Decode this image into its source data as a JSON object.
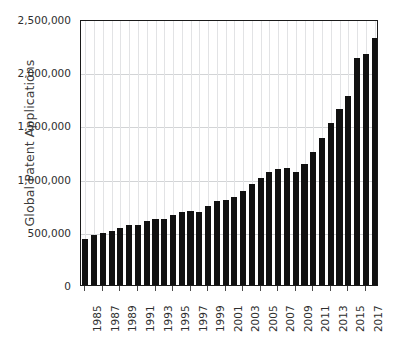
{
  "chart_data": {
    "type": "bar",
    "title": "",
    "xlabel": "",
    "ylabel": "Global Patent Applications",
    "ylim": [
      0,
      2500000
    ],
    "ytick_values": [
      2500000,
      2000000,
      1500000,
      1000000,
      500000,
      0
    ],
    "ytick_labels": [
      "2,500,000",
      "2,000,000",
      "1,500,000",
      "1,000,000",
      "500,000",
      "0"
    ],
    "xtick_labels": [
      "1985",
      "1987",
      "1989",
      "1991",
      "1993",
      "1995",
      "1997",
      "1999",
      "2001",
      "2003",
      "2005",
      "2007",
      "2009",
      "2011",
      "2013",
      "2015",
      "2017"
    ],
    "grid": "horizontal-and-vertical",
    "legend": "none",
    "bar_color": "#111111",
    "axis_color": "#1a1a1a",
    "gridline_color": "#d2d4d6",
    "background_color": "#ffffff",
    "categories": [
      "1985",
      "1986",
      "1987",
      "1988",
      "1989",
      "1990",
      "1991",
      "1992",
      "1993",
      "1994",
      "1995",
      "1996",
      "1997",
      "1998",
      "1999",
      "2000",
      "2001",
      "2002",
      "2003",
      "2004",
      "2005",
      "2006",
      "2007",
      "2008",
      "2009",
      "2010",
      "2011",
      "2012",
      "2013",
      "2014",
      "2015",
      "2016",
      "2017",
      "2018"
    ],
    "values": [
      435000,
      470000,
      490000,
      510000,
      540000,
      560000,
      565000,
      600000,
      620000,
      625000,
      660000,
      690000,
      700000,
      690000,
      745000,
      790000,
      800000,
      830000,
      880000,
      950000,
      1010000,
      1060000,
      1090000,
      1100000,
      1060000,
      1140000,
      1250000,
      1380000,
      1520000,
      1650000,
      1780000,
      2130000,
      2170000,
      2320000
    ]
  }
}
